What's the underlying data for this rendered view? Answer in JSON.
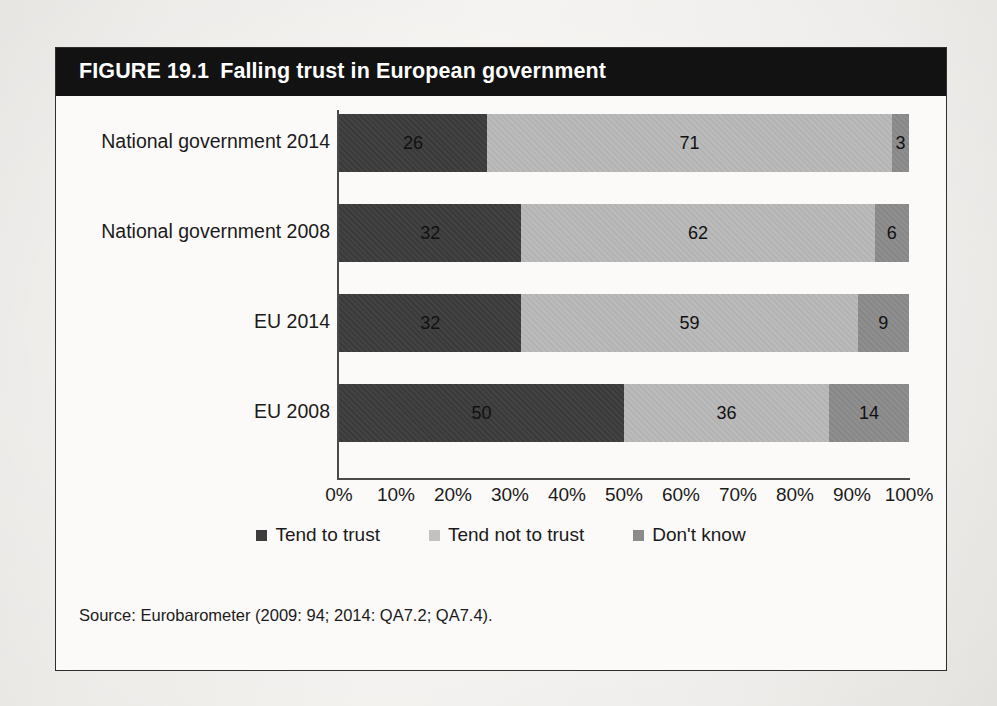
{
  "figure": {
    "number": "FIGURE 19.1",
    "title": "Falling trust in European government",
    "source": "Source: Eurobarometer (2009: 94; 2014: QA7.2; QA7.4)."
  },
  "colors": {
    "header_bg": "#121212",
    "header_text": "#ffffff",
    "series_tend_to_trust": "#3c3c3c",
    "series_tend_not_to_trust": "#b9b9b9",
    "series_dont_know": "#8b8b8b",
    "page_bg": "#eceae7",
    "figure_bg": "#fbfaf9",
    "axis": "#4a4a4a"
  },
  "chart_data": {
    "type": "bar",
    "orientation": "horizontal",
    "stacked": true,
    "normalized_percent": true,
    "title": "Falling trust in European government",
    "xlabel": "",
    "ylabel": "",
    "xlim": [
      0,
      100
    ],
    "grid": false,
    "legend_position": "bottom-center",
    "categories": [
      "National government 2014",
      "National government 2008",
      "EU 2014",
      "EU 2008"
    ],
    "series": [
      {
        "name": "Tend to trust",
        "color": "#3c3c3c",
        "values": [
          26,
          32,
          32,
          50
        ]
      },
      {
        "name": "Tend not to trust",
        "color": "#b9b9b9",
        "values": [
          71,
          62,
          59,
          36
        ]
      },
      {
        "name": "Don't know",
        "color": "#8b8b8b",
        "values": [
          3,
          6,
          9,
          14
        ]
      }
    ],
    "xticks": [
      "0%",
      "10%",
      "20%",
      "30%",
      "40%",
      "50%",
      "60%",
      "70%",
      "80%",
      "90%",
      "100%"
    ],
    "xtick_values": [
      0,
      10,
      20,
      30,
      40,
      50,
      60,
      70,
      80,
      90,
      100
    ],
    "data_labels": [
      {
        "category": "National government 2014",
        "Tend to trust": 26,
        "Tend not to trust": 71,
        "Don't know": 3
      },
      {
        "category": "National government 2008",
        "Tend to trust": 32,
        "Tend not to trust": 62,
        "Don't know": 6
      },
      {
        "category": "EU 2014",
        "Tend to trust": 32,
        "Tend not to trust": 59,
        "Don't know": 9
      },
      {
        "category": "EU 2008",
        "Tend to trust": 50,
        "Tend not to trust": 36,
        "Don't know": 14
      }
    ]
  }
}
